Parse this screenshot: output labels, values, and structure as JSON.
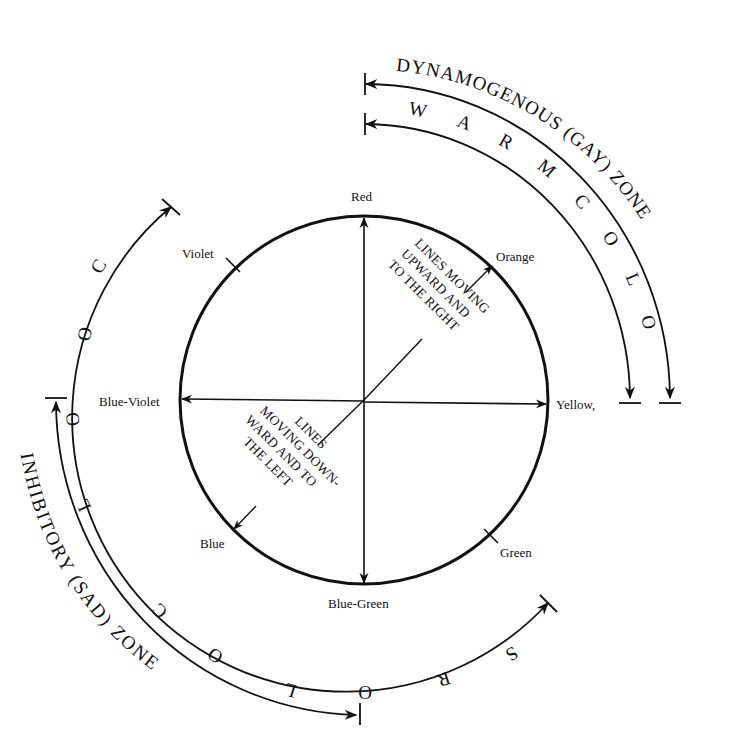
{
  "diagram": {
    "hue_labels": {
      "red": "Red",
      "orange": "Orange",
      "yellow": "Yellow,",
      "green": "Green",
      "blue_green": "Blue-Green",
      "blue": "Blue",
      "blue_violet": "Blue-Violet",
      "violet": "Violet"
    },
    "upward_note": {
      "line1": "LINES MOVING",
      "line2": "UPWARD AND",
      "line3": "TO THE RIGHT"
    },
    "downward_note": {
      "line1": "LINES",
      "line2": "MOVING DOWN-",
      "line3": "WARD AND TO",
      "line4": "THE LEFT"
    },
    "outer_arcs": {
      "dynamogenous_zone": "DYNAMOGENOUS (GAY) ZONE",
      "warm_colors": "W A R M   C O L O R S",
      "cool_colors": "C O O L   C O L O R S",
      "inhibitory_zone": "INHIBITORY (SAD) ZONE"
    },
    "colors": {
      "ink": "#111111",
      "background": "#ffffff"
    }
  }
}
